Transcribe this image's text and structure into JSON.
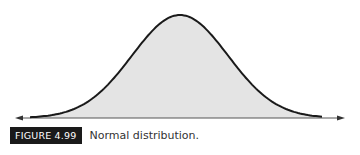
{
  "figure": {
    "label": "FIGURE 4.99",
    "caption": "Normal distribution.",
    "curve": {
      "type": "normal",
      "peak_x": 180,
      "peak_y": 15,
      "baseline_y": 118,
      "axis_start_x": 15,
      "axis_end_x": 345,
      "sigma_px": 48,
      "fill_color": "#e4e4e4",
      "stroke_color": "#1a1a1a"
    }
  }
}
